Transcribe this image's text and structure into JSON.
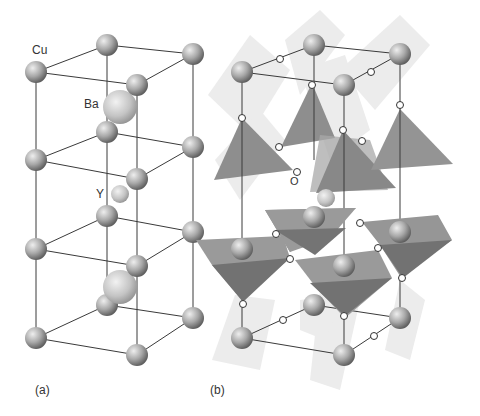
{
  "figure": {
    "panel_a": {
      "tag": "(a)",
      "atom_labels": {
        "cu": "Cu",
        "ba": "Ba",
        "y": "Y"
      }
    },
    "panel_b": {
      "tag": "(b)",
      "atom_labels": {
        "o": "O"
      }
    }
  },
  "colors": {
    "bond": "#333333",
    "atom_light": "#e6e6e6",
    "atom_dark": "#6e6e6e",
    "pyramid_light": "#9a9a9a",
    "pyramid_dark": "#7a7a7a",
    "plane": "#e8e8e8",
    "oxygen_fill": "#ffffff"
  }
}
